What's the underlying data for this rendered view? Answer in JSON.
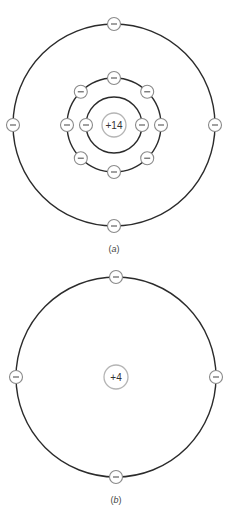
{
  "diagrams": [
    {
      "id": "a",
      "caption": "(a)",
      "caption_letter": "a",
      "nucleus_label": "+14",
      "center": [
        114,
        125
      ],
      "shells": [
        {
          "radius": 28,
          "electrons": 2,
          "angles": [
            0,
            180
          ]
        },
        {
          "radius": 47,
          "electrons": 8,
          "angles": [
            0,
            45,
            90,
            135,
            180,
            225,
            270,
            315
          ]
        },
        {
          "radius": 101,
          "electrons": 4,
          "angles": [
            0,
            90,
            180,
            270
          ]
        }
      ]
    },
    {
      "id": "b",
      "caption": "(b)",
      "caption_letter": "b",
      "nucleus_label": "+4",
      "center": [
        116,
        377
      ],
      "shells": [
        {
          "radius": 100,
          "electrons": 4,
          "angles": [
            0,
            90,
            180,
            270
          ]
        }
      ]
    }
  ],
  "electron_symbol": "minus",
  "colors": {
    "orbit": "#2b2b2b",
    "electron_outline": "#8a8a8a",
    "nucleus_outline": "#b5b5b5",
    "text": "#333333"
  }
}
